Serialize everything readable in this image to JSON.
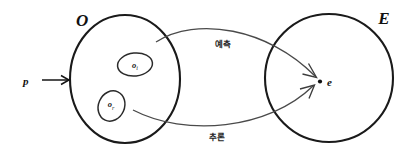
{
  "diagram": {
    "background_color": "#ffffff",
    "stroke_color": "#1a1a1a",
    "curve_color": "#4a4a4a",
    "sets": {
      "observation": {
        "label": "O",
        "subsets": [
          {
            "name": "o-i",
            "label": "o",
            "subscript": "i"
          },
          {
            "name": "o-r",
            "label": "o",
            "subscript": "r"
          }
        ]
      },
      "evidence": {
        "label": "E",
        "element_label": "e"
      }
    },
    "input": {
      "label": "p",
      "arrow_icon": "right-arrow-icon"
    },
    "edges": [
      {
        "name": "prediction-edge",
        "label": "예측",
        "from": "o-i",
        "to": "e"
      },
      {
        "name": "inference-edge",
        "label": "추론",
        "from": "o-r",
        "to": "e"
      }
    ]
  }
}
